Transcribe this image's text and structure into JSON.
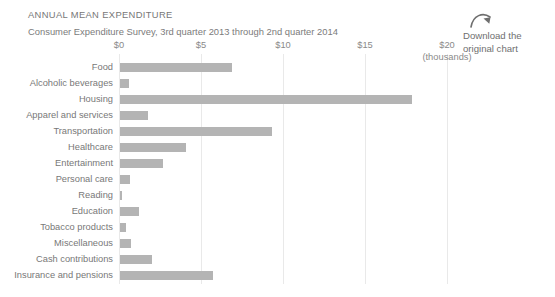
{
  "header": {
    "title": "ANNUAL MEAN EXPENDITURE",
    "subtitle": "Consumer Expenditure Survey, 3rd quarter 2013 through 2nd quarter 2014"
  },
  "download": {
    "icon": "curved-arrow-icon",
    "line1": "Download the",
    "line2": "original chart"
  },
  "axis": {
    "unit_note": "(thousands)",
    "ticks": [
      "$0",
      "$5",
      "$10",
      "$15",
      "$20"
    ]
  },
  "colors": {
    "bar": "#b4b4b4",
    "gridline": "#e9e9e9",
    "text": "#787878"
  },
  "chart_data": {
    "type": "bar",
    "orientation": "horizontal",
    "title": "ANNUAL MEAN EXPENDITURE",
    "subtitle": "Consumer Expenditure Survey, 3rd quarter 2013 through 2nd quarter 2014",
    "xlabel": "(thousands)",
    "ylabel": "",
    "xlim": [
      0,
      20
    ],
    "xticks": [
      0,
      5,
      10,
      15,
      20
    ],
    "xticklabels": [
      "$0",
      "$5",
      "$10",
      "$15",
      "$20"
    ],
    "grid": true,
    "legend": false,
    "categories": [
      "Food",
      "Alcoholic beverages",
      "Housing",
      "Apparel and services",
      "Transportation",
      "Healthcare",
      "Entertainment",
      "Personal care",
      "Reading",
      "Education",
      "Tobacco products",
      "Miscellaneous",
      "Cash contributions",
      "Insurance and pensions"
    ],
    "values": [
      6.8,
      0.55,
      17.8,
      1.7,
      9.25,
      4.0,
      2.6,
      0.6,
      0.1,
      1.15,
      0.35,
      0.67,
      1.95,
      5.65
    ]
  }
}
